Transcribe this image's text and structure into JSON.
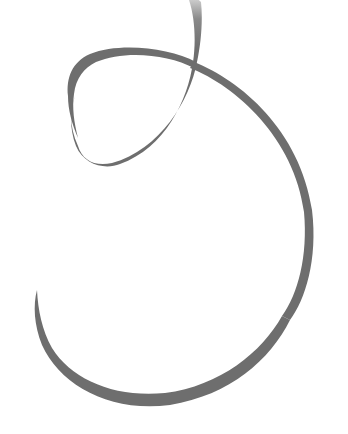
{
  "image": {
    "subject": "gray ribbon curl illustration",
    "background_color": "#ffffff",
    "ribbon_color": "#6e6e6e",
    "ribbon_fade_color": "#b8b8b8"
  }
}
